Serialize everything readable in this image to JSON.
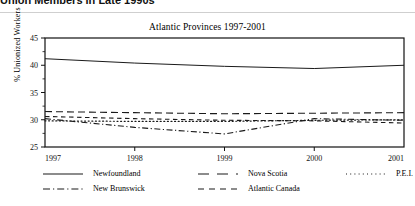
{
  "page": {
    "top_heading": "Union Members in Late 1990s"
  },
  "chart_data": {
    "type": "line",
    "title": "Atlantic Provinces 1997-2001",
    "xlabel": "",
    "ylabel": "% Unionized Workers",
    "x": [
      1997,
      1998,
      1999,
      2000,
      2001
    ],
    "xtick_labels": [
      "1997",
      "1998",
      "1999",
      "2000",
      "2001"
    ],
    "ytick_labels": [
      "25",
      "30",
      "35",
      "40",
      "45"
    ],
    "ytick_values": [
      25,
      30,
      35,
      40,
      45
    ],
    "xlim": [
      1997,
      2001
    ],
    "ylim": [
      25,
      45
    ],
    "grid": false,
    "legend_position": "below",
    "series": [
      {
        "name": "Newfoundland",
        "style": "solid",
        "values": [
          41.2,
          40.4,
          39.8,
          39.4,
          40.0
        ]
      },
      {
        "name": "Nova Scotia",
        "style": "long-dash",
        "values": [
          31.5,
          31.3,
          31.1,
          31.2,
          31.3
        ]
      },
      {
        "name": "P.E.I.",
        "style": "dotted",
        "values": [
          29.8,
          29.7,
          29.7,
          29.9,
          30.0
        ]
      },
      {
        "name": "New Brunswick",
        "style": "dash-dot",
        "values": [
          30.2,
          28.6,
          27.4,
          30.2,
          29.9
        ]
      },
      {
        "name": "Atlantic Canada",
        "style": "dashed",
        "values": [
          30.6,
          30.2,
          29.9,
          29.8,
          29.4
        ]
      }
    ]
  },
  "legend": {
    "items": [
      {
        "label": "Newfoundland"
      },
      {
        "label": "Nova Scotia"
      },
      {
        "label": "P.E.I."
      },
      {
        "label": "New Brunswick"
      },
      {
        "label": "Atlantic Canada"
      }
    ]
  },
  "colors": {
    "line": "#1a1a1a",
    "axis": "#000000",
    "background": "#ffffff"
  }
}
